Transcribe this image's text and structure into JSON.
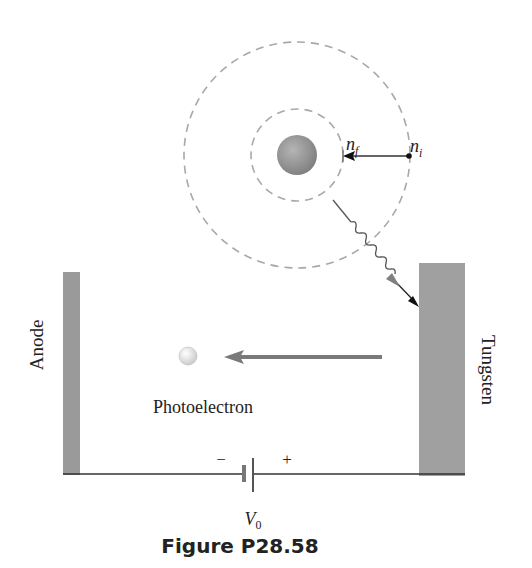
{
  "figure": {
    "caption": "Figure P28.58",
    "labels": {
      "anode": "Anode",
      "tungsten": "Tungsten",
      "photoelectron": "Photoelectron",
      "minus": "−",
      "plus": "+",
      "voltage": "V",
      "voltage_sub": "0",
      "n_final": "n",
      "n_final_sub": "f",
      "n_initial": "n",
      "n_initial_sub": "i"
    },
    "colors": {
      "plate": "#9a9a9a",
      "orbit_dash": "#a8a8a8",
      "nucleus": "#8e8e8e",
      "wire": "#333333",
      "arrow_gray": "#777777",
      "arrow_black": "#111111",
      "electron": "#e6e6e6"
    },
    "elements": {
      "atom": {
        "center": [
          297,
          155
        ],
        "outer_orbit_radius": 113,
        "inner_orbit_radius": 46,
        "nucleus_radius": 20
      },
      "transition_arrow": {
        "from": "n_i",
        "to": "n_f"
      },
      "photon": {
        "emitted_from": "atom",
        "target": "tungsten plate"
      },
      "photoelectron_arrow": {
        "direction": "left",
        "toward": "anode"
      },
      "battery": {
        "label": "V0",
        "negative_side": "left",
        "positive_side": "right"
      }
    }
  }
}
